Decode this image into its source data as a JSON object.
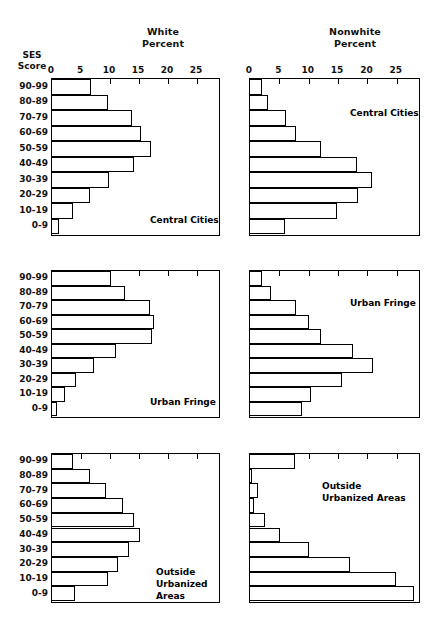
{
  "figure": {
    "ses_caption": "SES\nScore",
    "column_titles": [
      {
        "key": "white",
        "label": "White\nPercent"
      },
      {
        "key": "nonwhite",
        "label": "Nonwhite\nPercent"
      }
    ]
  },
  "chart_data": {
    "type": "bar",
    "orientation": "horizontal",
    "title": "",
    "xlabel": "Percent",
    "ylabel": "SES Score",
    "xlim": [
      0,
      28.6
    ],
    "xticks": [
      0,
      5,
      10,
      15,
      20,
      25
    ],
    "xtick_labels": [
      "0",
      "5",
      "10",
      "15",
      "20",
      "25"
    ],
    "grid": false,
    "legend": "none",
    "categories": [
      "90-99",
      "80-89",
      "70-79",
      "60-69",
      "50-59",
      "40-49",
      "30-39",
      "20-29",
      "10-19",
      "0-9"
    ],
    "panels": [
      {
        "row": 0,
        "col": 0,
        "race": "White",
        "annotation": "Central Cities",
        "values": [
          6.8,
          9.7,
          13.8,
          15.4,
          17.1,
          14.1,
          9.8,
          6.6,
          3.6,
          1.2
        ]
      },
      {
        "row": 0,
        "col": 1,
        "race": "Nonwhite",
        "annotation": "Central Cities",
        "values": [
          2.0,
          3.1,
          6.1,
          7.8,
          12.1,
          18.2,
          20.8,
          18.4,
          14.8,
          5.9
        ]
      },
      {
        "row": 1,
        "col": 0,
        "race": "White",
        "annotation": "Urban Fringe",
        "values": [
          10.2,
          12.6,
          16.8,
          17.6,
          17.3,
          11.1,
          7.3,
          4.2,
          2.2,
          0.8
        ]
      },
      {
        "row": 1,
        "col": 1,
        "race": "Nonwhite",
        "annotation": "Urban Fringe",
        "values": [
          2.1,
          3.6,
          7.9,
          10.1,
          12.1,
          17.6,
          21.0,
          15.7,
          10.4,
          8.8
        ]
      },
      {
        "row": 2,
        "col": 0,
        "race": "White",
        "annotation": "Outside\nUrbanized\nAreas",
        "values": [
          3.6,
          6.6,
          9.3,
          12.3,
          14.1,
          15.2,
          13.2,
          11.4,
          9.7,
          4.0
        ]
      },
      {
        "row": 2,
        "col": 1,
        "race": "Nonwhite",
        "annotation": "Outside\nUrbanized Areas",
        "values": [
          7.6,
          0.3,
          1.3,
          0.6,
          2.5,
          5.1,
          10.1,
          17.0,
          24.8,
          27.9
        ]
      }
    ]
  },
  "layout": {
    "annotation_positions": [
      {
        "left": 98,
        "top": 135
      },
      {
        "left": 100,
        "top": 28
      },
      {
        "left": 98,
        "top": 125
      },
      {
        "left": 100,
        "top": 26
      },
      {
        "left": 104,
        "top": 112
      },
      {
        "left": 72,
        "top": 26
      }
    ],
    "panel_boxes": [
      {
        "left": 51,
        "top": 78,
        "width": 169,
        "height": 158
      },
      {
        "left": 249,
        "top": 78,
        "width": 171,
        "height": 158
      },
      {
        "left": 51,
        "top": 270,
        "width": 169,
        "height": 148
      },
      {
        "left": 249,
        "top": 270,
        "width": 171,
        "height": 148
      },
      {
        "left": 51,
        "top": 453,
        "width": 169,
        "height": 150
      },
      {
        "left": 249,
        "top": 453,
        "width": 171,
        "height": 150
      }
    ]
  },
  "colors": {
    "ink": "#000000",
    "paper": "#ffffff",
    "bar_fill": "#ffffff",
    "bar_stroke": "#000000"
  }
}
